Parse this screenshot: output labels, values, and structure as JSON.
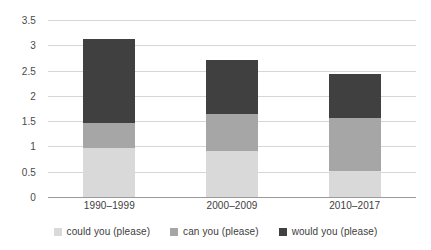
{
  "chart_data": {
    "type": "bar",
    "stacked": true,
    "title": "",
    "subtitle": "",
    "xlabel": "",
    "ylabel": "",
    "categories": [
      "1990–1999",
      "2000–2009",
      "2010–2017"
    ],
    "series": [
      {
        "name": "could you (please)",
        "color": "#d9d9d9",
        "values": [
          0.96,
          0.9,
          0.52
        ]
      },
      {
        "name": "can you (please)",
        "color": "#a6a6a6",
        "values": [
          0.5,
          0.74,
          1.04
        ]
      },
      {
        "name": "would you (please)",
        "color": "#404040",
        "values": [
          1.66,
          1.06,
          0.88
        ]
      }
    ],
    "totals": [
      3.12,
      2.7,
      2.44
    ],
    "ylim": [
      0,
      3.5
    ],
    "ytick_values": [
      0,
      0.5,
      1,
      1.5,
      2,
      2.5,
      3,
      3.5
    ],
    "ytick_labels": [
      "0",
      "0.5",
      "1",
      "1.5",
      "2",
      "2.5",
      "3",
      "3.5"
    ],
    "grid": true,
    "grid_color": "#d6d6d6",
    "axis_color": "#9a9a9a",
    "legend": {
      "position": "bottom",
      "entries": [
        {
          "label": "could you (please)",
          "color": "#d9d9d9"
        },
        {
          "label": "can you (please)",
          "color": "#a6a6a6"
        },
        {
          "label": "would you (please)",
          "color": "#404040"
        }
      ]
    },
    "background": "#ffffff"
  }
}
